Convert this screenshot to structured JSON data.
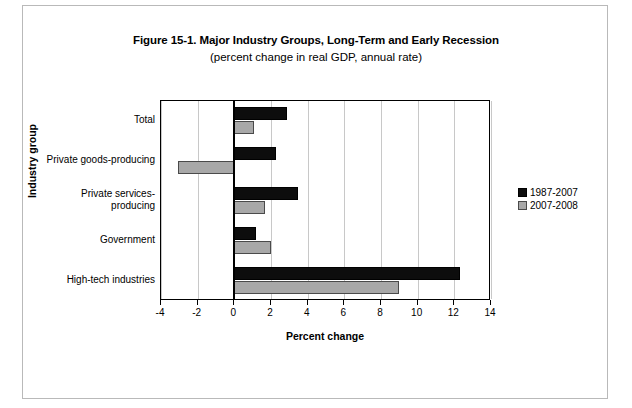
{
  "chart_data": {
    "type": "bar",
    "orientation": "horizontal",
    "title": "Figure 15-1. Major Industry Groups, Long-Term and Early Recession",
    "subtitle": "(percent change in real GDP, annual rate)",
    "xlabel": "Percent change",
    "ylabel": "Industry group",
    "categories": [
      "Total",
      "Private goods-producing",
      "Private services-producing",
      "Government",
      "High-tech industries"
    ],
    "series": [
      {
        "name": "1987-2007",
        "color": "#0d0d0d",
        "values": [
          2.9,
          2.3,
          3.5,
          1.2,
          12.3
        ]
      },
      {
        "name": "2007-2008",
        "color": "#a8a8a8",
        "values": [
          1.1,
          -3.1,
          1.7,
          2.0,
          9.0
        ]
      }
    ],
    "xlim": [
      -4,
      14
    ],
    "xticks": [
      -4,
      -2,
      0,
      2,
      4,
      6,
      8,
      10,
      12,
      14
    ],
    "xticklabels": [
      "-4",
      "-2",
      "0",
      "2",
      "4",
      "6",
      "8",
      "10",
      "12",
      "14"
    ],
    "grid": true,
    "grid_axis": "x",
    "legend_position": "right"
  },
  "legend": {
    "entries": [
      {
        "label": "1987-2007"
      },
      {
        "label": "2007-2008"
      }
    ]
  }
}
